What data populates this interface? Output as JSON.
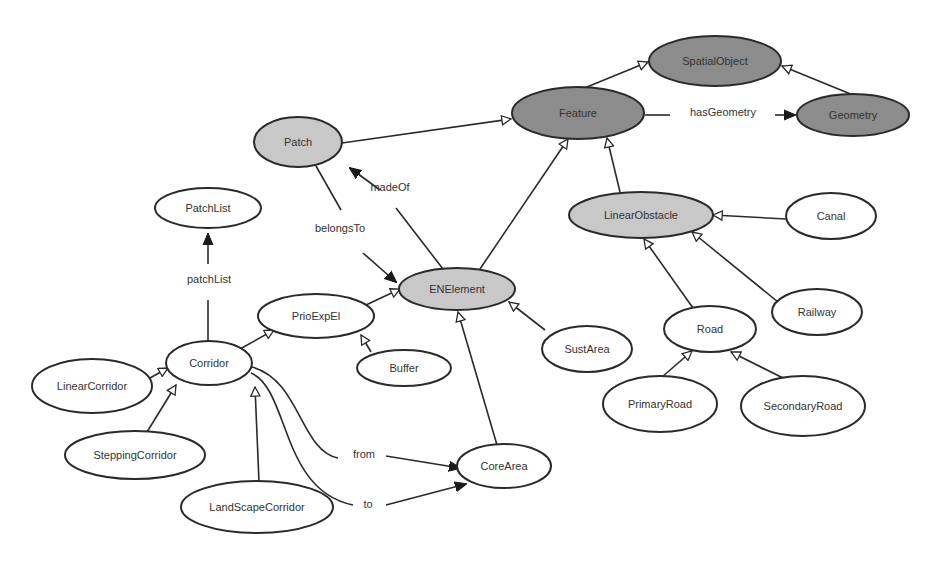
{
  "colors": {
    "dark_fill": "#8c8c8c",
    "light_fill": "#c8c8c8",
    "white_fill": "#ffffff",
    "stroke": "#2a2a2a",
    "text": "#333333"
  },
  "nodes": [
    {
      "id": "SpatialObject",
      "label": "SpatialObject",
      "cx": 715,
      "cy": 61,
      "rx": 66,
      "ry": 25,
      "style": "dark"
    },
    {
      "id": "Feature",
      "label": "Feature",
      "cx": 578,
      "cy": 113,
      "rx": 66,
      "ry": 26,
      "style": "dark"
    },
    {
      "id": "Geometry",
      "label": "Geometry",
      "cx": 853,
      "cy": 115,
      "rx": 56,
      "ry": 21,
      "style": "dark"
    },
    {
      "id": "Patch",
      "label": "Patch",
      "cx": 298,
      "cy": 142,
      "rx": 44,
      "ry": 25,
      "style": "light"
    },
    {
      "id": "LinearObstacle",
      "label": "LinearObstacle",
      "cx": 641,
      "cy": 215,
      "rx": 72,
      "ry": 23,
      "style": "light"
    },
    {
      "id": "Canal",
      "label": "Canal",
      "cx": 831,
      "cy": 216,
      "rx": 45,
      "ry": 23,
      "style": "white"
    },
    {
      "id": "PatchList",
      "label": "PatchList",
      "cx": 208,
      "cy": 208,
      "rx": 53,
      "ry": 20,
      "style": "white"
    },
    {
      "id": "ENElement",
      "label": "ENElement",
      "cx": 457,
      "cy": 289,
      "rx": 58,
      "ry": 21,
      "style": "light"
    },
    {
      "id": "PrioExpEl",
      "label": "PrioExpEl",
      "cx": 316,
      "cy": 316,
      "rx": 58,
      "ry": 22,
      "style": "white"
    },
    {
      "id": "Railway",
      "label": "Railway",
      "cx": 817,
      "cy": 312,
      "rx": 45,
      "ry": 23,
      "style": "white"
    },
    {
      "id": "Road",
      "label": "Road",
      "cx": 710,
      "cy": 329,
      "rx": 46,
      "ry": 23,
      "style": "white"
    },
    {
      "id": "SustArea",
      "label": "SustArea",
      "cx": 587,
      "cy": 349,
      "rx": 45,
      "ry": 23,
      "style": "white"
    },
    {
      "id": "Corridor",
      "label": "Corridor",
      "cx": 209,
      "cy": 363,
      "rx": 43,
      "ry": 22,
      "style": "white"
    },
    {
      "id": "Buffer",
      "label": "Buffer",
      "cx": 404,
      "cy": 368,
      "rx": 47,
      "ry": 18,
      "style": "white"
    },
    {
      "id": "LinearCorridor",
      "label": "LinearCorridor",
      "cx": 92,
      "cy": 386,
      "rx": 60,
      "ry": 27,
      "style": "white"
    },
    {
      "id": "PrimaryRoad",
      "label": "PrimaryRoad",
      "cx": 660,
      "cy": 404,
      "rx": 57,
      "ry": 28,
      "style": "white"
    },
    {
      "id": "SecondaryRoad",
      "label": "SecondaryRoad",
      "cx": 803,
      "cy": 406,
      "rx": 62,
      "ry": 30,
      "style": "white"
    },
    {
      "id": "SteppingCorridor",
      "label": "SteppingCorridor",
      "cx": 135,
      "cy": 455,
      "rx": 70,
      "ry": 24,
      "style": "white"
    },
    {
      "id": "CoreArea",
      "label": "CoreArea",
      "cx": 504,
      "cy": 466,
      "rx": 47,
      "ry": 22,
      "style": "white"
    },
    {
      "id": "LandScapeCorridor",
      "label": "LandScapeCorridor",
      "cx": 257,
      "cy": 507,
      "rx": 76,
      "ry": 26,
      "style": "white"
    }
  ],
  "edges": [
    {
      "from": "Feature",
      "to": "SpatialObject",
      "type": "inheritance",
      "path": "M 582 89 L 648 62"
    },
    {
      "from": "Geometry",
      "to": "SpatialObject",
      "type": "inheritance",
      "path": "M 853 95 L 782 66"
    },
    {
      "from": "Patch",
      "to": "Feature",
      "type": "inheritance",
      "path": "M 342 143 L 511 119"
    },
    {
      "from": "ENElement",
      "to": "Feature",
      "type": "inheritance",
      "path": "M 480 269 L 568 139"
    },
    {
      "from": "LinearObstacle",
      "to": "Feature",
      "type": "inheritance",
      "path": "M 620 192 L 607 138"
    },
    {
      "from": "Canal",
      "to": "LinearObstacle",
      "type": "inheritance",
      "path": "M 786 219 L 713 215"
    },
    {
      "from": "Railway",
      "to": "LinearObstacle",
      "type": "inheritance",
      "path": "M 778 302 L 692 232"
    },
    {
      "from": "Road",
      "to": "LinearObstacle",
      "type": "inheritance",
      "path": "M 693 308 L 644 239"
    },
    {
      "from": "PrimaryRoad",
      "to": "Road",
      "type": "inheritance",
      "path": "M 662 377 L 692 351"
    },
    {
      "from": "SecondaryRoad",
      "to": "Road",
      "type": "inheritance",
      "path": "M 783 378 L 731 352"
    },
    {
      "from": "PrioExpEl",
      "to": "ENElement",
      "type": "inheritance",
      "path": "M 366 305 L 400 289"
    },
    {
      "from": "SustArea",
      "to": "ENElement",
      "type": "inheritance",
      "path": "M 545 330 L 509 302"
    },
    {
      "from": "CoreArea",
      "to": "ENElement",
      "type": "inheritance",
      "path": "M 497 445 L 458 312"
    },
    {
      "from": "Buffer",
      "to": "PrioExpEl",
      "type": "inheritance",
      "path": "M 371 352 L 361 335"
    },
    {
      "from": "Corridor",
      "to": "PrioExpEl",
      "type": "inheritance",
      "path": "M 240 349 L 274 330"
    },
    {
      "from": "LinearCorridor",
      "to": "Corridor",
      "type": "inheritance",
      "path": "M 150 378 L 168 368"
    },
    {
      "from": "SteppingCorridor",
      "to": "Corridor",
      "type": "inheritance",
      "path": "M 147 432 L 176 385"
    },
    {
      "from": "LandScapeCorridor",
      "to": "Corridor",
      "type": "inheritance",
      "path": "M 259 482 L 255 387"
    }
  ],
  "associations": [
    {
      "from": "Feature",
      "to": "Geometry",
      "label": "hasGeometry",
      "path1": "M 645 115 L 670 115",
      "path2": "M 775 115 L 795 115",
      "label_x": 723,
      "label_y": 112,
      "arrow_end_x": 797,
      "arrow_end_y": 115,
      "arrow_dir": 0
    },
    {
      "from": "ENElement",
      "to": "Patch",
      "label": "madeOf",
      "path1": "M 443 269 L 396 208",
      "path2": "M 380 190 L 350 168",
      "label_x": 390,
      "label_y": 187,
      "arrow_end_x": 334,
      "arrow_end_y": 160,
      "arrow_dir": 216
    },
    {
      "from": "Patch",
      "to": "ENElement",
      "label": "belongsTo",
      "path1": "M 316 166 L 341 210",
      "path2": "M 363 253 Q 380 268 396 282",
      "label_x": 340,
      "label_y": 228,
      "arrow_end_x": 401,
      "arrow_end_y": 285,
      "arrow_dir": 40
    },
    {
      "from": "Corridor",
      "to": "PatchList",
      "label": "patchList",
      "path1": "M 208 342 L 208 300",
      "path2": "M 208 264 L 208 234",
      "label_x": 209,
      "label_y": 279,
      "arrow_end_x": 208,
      "arrow_end_y": 229,
      "arrow_dir": -90
    },
    {
      "from": "Corridor",
      "to": "CoreArea",
      "label": "from",
      "path1": "M 252 367 C 300 380 300 450 338 458",
      "path2": "M 386 456 L 460 468",
      "label_x": 364,
      "label_y": 454,
      "arrow_end_x": 463,
      "arrow_end_y": 468,
      "arrow_dir": 9
    },
    {
      "from": "Corridor",
      "to": "CoreArea",
      "label": "to",
      "path1": "M 251 373 C 290 390 280 490 353 505",
      "path2": "M 386 505 L 466 484",
      "label_x": 368,
      "label_y": 504,
      "arrow_end_x": 470,
      "arrow_end_y": 483,
      "arrow_dir": -15
    }
  ]
}
